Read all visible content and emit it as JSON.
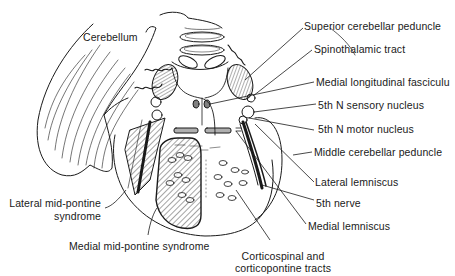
{
  "figure": {
    "ink_color": "#1a1a1a",
    "background_color": "#ffffff"
  },
  "labels": {
    "cerebellum": "Cerebellum",
    "superior_cerebellar_peduncle": "Superior cerebellar peduncle",
    "spinothalamic_tract": "Spinothalamic tract",
    "medial_longitudinal_fasciculus": "Medial longitudinal fasciculu",
    "fifth_n_sensory_nucleus": "5th N sensory nucleus",
    "fifth_n_motor_nucleus": "5th N motor nucleus",
    "middle_cerebellar_peduncle": "Middle cerebellar peduncle",
    "lateral_lemniscus": "Lateral lemniscus",
    "fifth_nerve": "5th nerve",
    "medial_lemniscus": "Medial lemniscus",
    "lateral_mid_pontine_line1": "Lateral mid-pontine",
    "lateral_mid_pontine_line2": "syndrome",
    "medial_mid_pontine": "Medial mid-pontine syndrome",
    "corticospinal_line1": "Corticospinal and",
    "corticospinal_line2": "corticopontine tracts"
  }
}
